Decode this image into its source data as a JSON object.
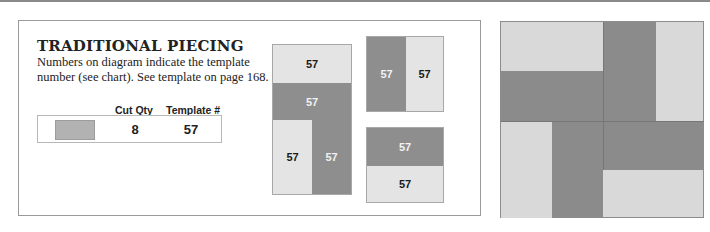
{
  "section": {
    "title": "TRADITIONAL PIECING",
    "description": "Numbers on diagram indicate the template number (see chart). See template on page 168."
  },
  "cutting_table": {
    "headers": [
      "Cut Qty",
      "Template #"
    ],
    "rows": [
      {
        "swatch_color": "#b2b2b2",
        "cut_qty": "8",
        "template": "57"
      }
    ]
  },
  "diagram": {
    "colors": {
      "light": "#e4e4e4",
      "dark": "#8e8e8e"
    },
    "left_unit": {
      "pieces": [
        {
          "label": "57",
          "shade": "light"
        },
        {
          "label": "57",
          "shade": "dark"
        },
        {
          "label": "57",
          "shade": "light"
        },
        {
          "label": "57",
          "shade": "dark"
        }
      ]
    },
    "top_right_unit": {
      "pieces": [
        {
          "label": "57",
          "shade": "dark"
        },
        {
          "label": "57",
          "shade": "light"
        }
      ]
    },
    "bottom_right_unit": {
      "pieces": [
        {
          "label": "57",
          "shade": "dark"
        },
        {
          "label": "57",
          "shade": "light"
        }
      ]
    }
  },
  "quilt_block": {
    "colors": {
      "light": "#d9d9d9",
      "dark": "#8b8b8b"
    }
  }
}
